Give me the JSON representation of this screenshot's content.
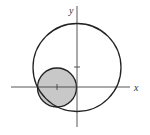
{
  "diagram": {
    "axes": {
      "x_label": "x",
      "y_label": "y",
      "origin": [
        77,
        87
      ],
      "x_range_px": [
        11,
        130
      ],
      "y_range_px": [
        6,
        127
      ]
    },
    "ticks": [
      {
        "axis": "y",
        "position_px": 67,
        "value": "1"
      },
      {
        "axis": "x",
        "position_px": 57,
        "value": "-1"
      }
    ],
    "large_circle": {
      "cx": 77,
      "cy": 67.5,
      "r": 44,
      "stroke": "#222222",
      "fill": "none"
    },
    "small_circle": {
      "cx": 57,
      "cy": 87.5,
      "r": 19.5,
      "stroke": "#222222",
      "fill": "#c8c8c8"
    }
  }
}
